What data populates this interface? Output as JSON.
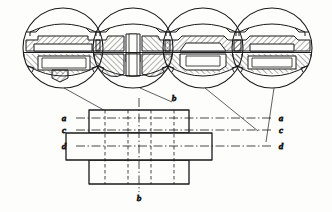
{
  "drawing": {
    "title": "Sectional views of a machine part",
    "type": "engineering-section-drawing",
    "line_color": "#1a1a1a",
    "hatch_color": "#1a1a1a",
    "background": "#fdfdfc"
  },
  "detail_views": [
    {
      "id": "view-a",
      "section_label": "a",
      "center_x": 63,
      "center_y": 48,
      "radius": 41
    },
    {
      "id": "view-b",
      "section_label": "b",
      "center_x": 133,
      "center_y": 48,
      "radius": 41
    },
    {
      "id": "view-c",
      "section_label": "c",
      "center_x": 203,
      "center_y": 48,
      "radius": 41
    },
    {
      "id": "view-d",
      "section_label": "d",
      "center_x": 272,
      "center_y": 48,
      "radius": 41
    }
  ],
  "plan_view": {
    "name": "plan-view",
    "rectangles": [
      {
        "id": "top-flange",
        "x": 89,
        "y": 110,
        "w": 100,
        "h": 23
      },
      {
        "id": "middle-body",
        "x": 66,
        "y": 133,
        "w": 146,
        "h": 27
      },
      {
        "id": "bottom-flange",
        "x": 89,
        "y": 160,
        "w": 100,
        "h": 24
      }
    ],
    "hidden_lines_x": [
      105,
      128,
      151,
      174
    ],
    "center_line_x": 139
  },
  "section_labels": {
    "left": [
      {
        "text": "a",
        "x": 69,
        "y": 121
      },
      {
        "text": "c",
        "x": 69,
        "y": 133
      },
      {
        "text": "d",
        "x": 69,
        "y": 147
      }
    ],
    "right": [
      {
        "text": "a",
        "x": 277,
        "y": 121
      },
      {
        "text": "c",
        "x": 277,
        "y": 133
      },
      {
        "text": "d",
        "x": 277,
        "y": 147
      }
    ],
    "top": {
      "text": "b",
      "x": 173,
      "y": 100
    },
    "bottom": {
      "text": "b",
      "x": 137,
      "y": 197
    }
  },
  "section_lines": {
    "a": {
      "y": 118,
      "x1": 76,
      "x2": 272
    },
    "c": {
      "y": 130,
      "x1": 76,
      "x2": 272
    },
    "d": {
      "y": 144,
      "x1": 76,
      "x2": 272
    },
    "b": {
      "x": 139,
      "y1": 98,
      "y2": 192
    }
  },
  "leader_lines": [
    {
      "id": "leader-left-1",
      "x1": 64,
      "y1": 88,
      "x2": 118,
      "y2": 118
    },
    {
      "id": "leader-left-2",
      "x1": 133,
      "y1": 88,
      "x2": 173,
      "y2": 103
    },
    {
      "id": "leader-right-1",
      "x1": 203,
      "y1": 88,
      "x2": 255,
      "y2": 130
    },
    {
      "id": "leader-right-2",
      "x1": 272,
      "y1": 88,
      "x2": 268,
      "y2": 140
    }
  ]
}
